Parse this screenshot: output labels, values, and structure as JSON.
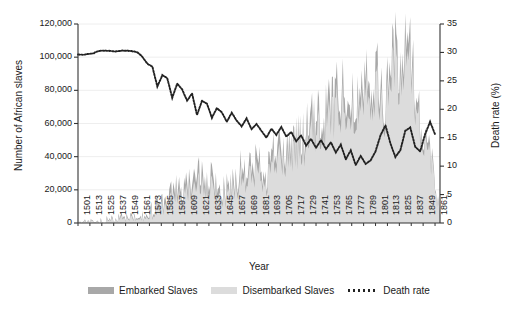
{
  "chart_data": {
    "type": "area",
    "title": "",
    "xlabel": "Year",
    "ylabel": "Number of African slaves",
    "ylabel_right": "Death rate (%)",
    "grid": true,
    "legend_position": "bottom",
    "ylim": [
      0,
      120000
    ],
    "ylim_right": [
      0,
      35
    ],
    "xlim": [
      1501,
      1866
    ],
    "yticks": [
      "0",
      "20,000",
      "40,000",
      "60,000",
      "80,000",
      "100,000",
      "120,000"
    ],
    "ytick_values": [
      0,
      20000,
      40000,
      60000,
      80000,
      100000,
      120000
    ],
    "yticks_right": [
      "0",
      "5",
      "10",
      "15",
      "20",
      "25",
      "30",
      "35"
    ],
    "ytick_values_right": [
      0,
      5,
      10,
      15,
      20,
      25,
      30,
      35
    ],
    "xticks": [
      "1501",
      "1513",
      "1525",
      "1537",
      "1549",
      "1561",
      "1573",
      "1585",
      "1597",
      "1609",
      "1621",
      "1633",
      "1645",
      "1657",
      "1669",
      "1681",
      "1693",
      "1705",
      "1717",
      "1729",
      "1741",
      "1753",
      "1765",
      "1777",
      "1789",
      "1801",
      "1813",
      "1825",
      "1837",
      "1849",
      "1861"
    ],
    "legend": [
      {
        "label": "Embarked Slaves",
        "color": "#a8a8a8",
        "style": "area"
      },
      {
        "label": "Disembarked Slaves",
        "color": "#dcdcdc",
        "style": "area"
      },
      {
        "label": "Death rate",
        "color": "#222222",
        "style": "dotted-line"
      }
    ],
    "series": [
      {
        "name": "Embarked Slaves",
        "color": "#a8a8a8",
        "axis": "left",
        "x": [
          1501,
          1506,
          1511,
          1516,
          1521,
          1526,
          1531,
          1536,
          1541,
          1546,
          1551,
          1556,
          1561,
          1566,
          1571,
          1576,
          1581,
          1586,
          1591,
          1596,
          1601,
          1606,
          1611,
          1616,
          1621,
          1626,
          1631,
          1636,
          1641,
          1646,
          1651,
          1656,
          1661,
          1666,
          1671,
          1676,
          1681,
          1686,
          1691,
          1696,
          1701,
          1706,
          1711,
          1716,
          1721,
          1726,
          1731,
          1736,
          1741,
          1746,
          1751,
          1756,
          1761,
          1766,
          1771,
          1776,
          1781,
          1786,
          1791,
          1796,
          1801,
          1806,
          1811,
          1816,
          1821,
          1826,
          1831,
          1836,
          1841,
          1846,
          1851,
          1856,
          1861,
          1866
        ],
        "values": [
          400,
          600,
          900,
          1100,
          1400,
          1600,
          1800,
          2000,
          2300,
          2600,
          2900,
          3200,
          3600,
          4500,
          6000,
          7500,
          9500,
          12000,
          14500,
          17000,
          20000,
          16000,
          21000,
          26000,
          32000,
          25000,
          20000,
          26000,
          22000,
          18000,
          20000,
          24000,
          28000,
          31000,
          27000,
          33000,
          36000,
          34000,
          30000,
          38000,
          45000,
          42000,
          40000,
          47000,
          52000,
          48000,
          55000,
          58000,
          62000,
          60000,
          66000,
          72000,
          78000,
          75000,
          82000,
          74000,
          68000,
          88000,
          95000,
          84000,
          90000,
          78000,
          70000,
          96000,
          104000,
          88000,
          106000,
          112000,
          80000,
          60000,
          52000,
          40000,
          28000,
          3000
        ]
      },
      {
        "name": "Disembarked Slaves",
        "color": "#dcdcdc",
        "axis": "left",
        "x": [
          1501,
          1506,
          1511,
          1516,
          1521,
          1526,
          1531,
          1536,
          1541,
          1546,
          1551,
          1556,
          1561,
          1566,
          1571,
          1576,
          1581,
          1586,
          1591,
          1596,
          1601,
          1606,
          1611,
          1616,
          1621,
          1626,
          1631,
          1636,
          1641,
          1646,
          1651,
          1656,
          1661,
          1666,
          1671,
          1676,
          1681,
          1686,
          1691,
          1696,
          1701,
          1706,
          1711,
          1716,
          1721,
          1726,
          1731,
          1736,
          1741,
          1746,
          1751,
          1756,
          1761,
          1766,
          1771,
          1776,
          1781,
          1786,
          1791,
          1796,
          1801,
          1806,
          1811,
          1816,
          1821,
          1826,
          1831,
          1836,
          1841,
          1846,
          1851,
          1856,
          1861,
          1866
        ],
        "values": [
          280,
          430,
          650,
          800,
          1000,
          1150,
          1300,
          1450,
          1700,
          1900,
          2100,
          2350,
          2650,
          3300,
          4400,
          5600,
          7100,
          9000,
          10900,
          12800,
          15200,
          12200,
          16100,
          20000,
          24700,
          19400,
          15600,
          20400,
          17400,
          14400,
          16100,
          19400,
          22700,
          25200,
          22100,
          27100,
          29600,
          28100,
          24900,
          31700,
          37600,
          35200,
          33700,
          39700,
          44100,
          41000,
          47100,
          49800,
          53500,
          51900,
          57300,
          62700,
          68100,
          65600,
          71800,
          64900,
          59900,
          77800,
          84300,
          74700,
          80200,
          69600,
          62600,
          86100,
          93600,
          79400,
          95900,
          101600,
          72800,
          54800,
          47600,
          36700,
          25700,
          2700
        ]
      },
      {
        "name": "Death rate",
        "color": "#222222",
        "axis": "right",
        "x": [
          1501,
          1506,
          1511,
          1516,
          1521,
          1526,
          1531,
          1536,
          1541,
          1546,
          1551,
          1556,
          1561,
          1566,
          1571,
          1576,
          1581,
          1586,
          1591,
          1596,
          1601,
          1606,
          1611,
          1616,
          1621,
          1626,
          1631,
          1636,
          1641,
          1646,
          1651,
          1656,
          1661,
          1666,
          1671,
          1676,
          1681,
          1686,
          1691,
          1696,
          1701,
          1706,
          1711,
          1716,
          1721,
          1726,
          1731,
          1736,
          1741,
          1746,
          1751,
          1756,
          1761,
          1766,
          1771,
          1776,
          1781,
          1786,
          1791,
          1796,
          1801,
          1806,
          1811,
          1816,
          1821,
          1826,
          1831,
          1836,
          1841,
          1846,
          1851,
          1856,
          1861
        ],
        "values": [
          29.6,
          29.6,
          29.7,
          29.8,
          30.2,
          30.3,
          30.3,
          30.2,
          30.2,
          30.3,
          30.3,
          30.2,
          30.0,
          29.2,
          28.0,
          27.5,
          24.0,
          26.0,
          25.5,
          22.0,
          24.5,
          23.5,
          21.5,
          22.8,
          19.0,
          21.5,
          21.0,
          18.5,
          20.2,
          19.5,
          17.8,
          19.4,
          18.0,
          17.0,
          18.4,
          16.5,
          17.4,
          16.2,
          15.0,
          16.6,
          15.5,
          16.9,
          15.2,
          16.0,
          14.4,
          15.4,
          13.6,
          14.8,
          13.2,
          14.6,
          13.0,
          14.2,
          12.4,
          13.8,
          11.2,
          12.8,
          10.2,
          11.8,
          10.4,
          11.0,
          12.6,
          15.4,
          17.2,
          14.0,
          11.6,
          12.8,
          16.2,
          16.8,
          13.4,
          12.6,
          15.6,
          17.8,
          15.6
        ]
      }
    ]
  }
}
